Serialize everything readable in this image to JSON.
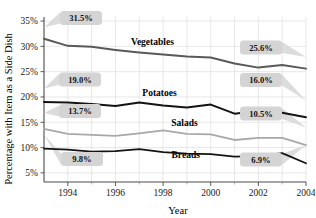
{
  "chart_data": {
    "type": "line",
    "title": "",
    "xlabel": "Year",
    "ylabel": "Percentage with Item as a Side Dish",
    "x": [
      1993,
      1994,
      1995,
      1996,
      1997,
      1998,
      1999,
      2000,
      2001,
      2002,
      2003,
      2004
    ],
    "xlim": [
      1993,
      2004
    ],
    "ylim": [
      3.2,
      35.8
    ],
    "xtick_labels": [
      "1994",
      "1996",
      "1998",
      "2000",
      "2002",
      "2004"
    ],
    "xtick_values": [
      1994,
      1996,
      1998,
      2000,
      2002,
      2004
    ],
    "ytick_labels": [
      "35%",
      "30%",
      "25%",
      "20%",
      "15%",
      "10%",
      "5%"
    ],
    "ytick_values": [
      35,
      30,
      25,
      20,
      15,
      10,
      5
    ],
    "grid": true,
    "legend": "inline-labels",
    "series": [
      {
        "name": "Vegetables",
        "color": "#595959",
        "width": 2.0,
        "values": [
          31.5,
          30.1,
          29.9,
          29.3,
          28.8,
          28.4,
          28.0,
          27.8,
          26.6,
          25.8,
          26.3,
          25.6
        ],
        "label_x": 1997.55,
        "label_y": 30.2,
        "start_value": "31.5%",
        "end_value": "25.6%"
      },
      {
        "name": "Potatoes",
        "color": "#141414",
        "width": 2.0,
        "values": [
          19.0,
          18.9,
          18.6,
          18.2,
          18.9,
          18.3,
          17.9,
          18.5,
          16.7,
          17.3,
          16.9,
          16.0
        ],
        "label_x": 1997.85,
        "label_y": 20.2,
        "start_value": "19.0%",
        "end_value": "16.0%"
      },
      {
        "name": "Salads",
        "color": "#a8a8a8",
        "width": 1.8,
        "values": [
          13.7,
          12.7,
          12.5,
          12.3,
          12.8,
          13.4,
          12.7,
          12.6,
          11.5,
          11.9,
          11.9,
          10.5
        ],
        "label_x": 1998.9,
        "label_y": 14.3,
        "start_value": "13.7%",
        "end_value": "10.5%"
      },
      {
        "name": "Breads",
        "color": "#141414",
        "width": 1.8,
        "values": [
          9.8,
          9.6,
          9.2,
          9.3,
          9.7,
          9.1,
          8.8,
          8.7,
          8.2,
          8.3,
          8.9,
          6.9
        ],
        "label_x": 1998.95,
        "label_y": 7.85,
        "start_value": "9.8%",
        "end_value": "6.9%"
      }
    ],
    "callouts": [
      {
        "name": "vegetables-start",
        "text": "31.5%",
        "side": "left",
        "box_x": 60.0,
        "box_y": 11.0,
        "target_x": 44.0,
        "target_y": 27.5
      },
      {
        "name": "vegetables-end",
        "text": "25.6%",
        "side": "right",
        "box_x": 240.0,
        "box_y": 40.5,
        "target_x": 306.0,
        "target_y": 57.0
      },
      {
        "name": "potatoes-start",
        "text": "19.0%",
        "side": "left",
        "box_x": 59.0,
        "box_y": 72.5,
        "target_x": 44.0,
        "target_y": 88.5
      },
      {
        "name": "potatoes-end",
        "text": "16.0%",
        "side": "right",
        "box_x": 240.0,
        "box_y": 73.0,
        "target_x": 306.0,
        "target_y": 100.5
      },
      {
        "name": "salads-start",
        "text": "13.7%",
        "side": "left",
        "box_x": 59.0,
        "box_y": 104.0,
        "target_x": 44.0,
        "target_y": 113.0
      },
      {
        "name": "salads-end",
        "text": "10.5%",
        "side": "right",
        "box_x": 240.0,
        "box_y": 106.5,
        "target_x": 306.0,
        "target_y": 127.5
      },
      {
        "name": "breads-start",
        "text": "9.8%",
        "side": "left",
        "box_x": 61.0,
        "box_y": 152.0,
        "target_x": 44.0,
        "target_y": 134.5
      },
      {
        "name": "breads-end",
        "text": "6.9%",
        "side": "right",
        "box_x": 240.0,
        "box_y": 152.5,
        "target_x": 306.0,
        "target_y": 145.0
      }
    ]
  },
  "colors": {
    "background": "#ffffff",
    "grid": "#d8d8d8",
    "axis": "#4a4a4a",
    "callout_box": "#d4d4d4",
    "callout_leader": "#dcdcdc"
  }
}
